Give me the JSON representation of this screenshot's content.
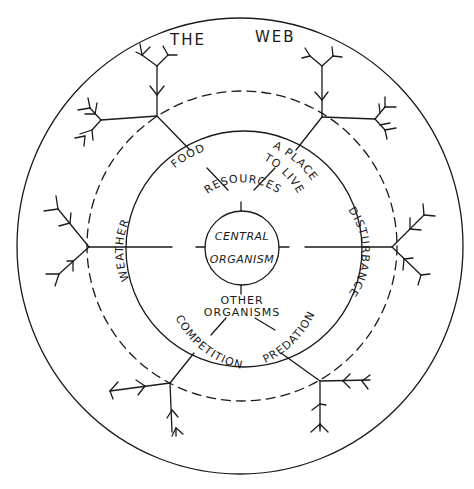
{
  "diagram": {
    "title": {
      "word1": "THE",
      "word2": "WEB"
    },
    "center": {
      "line1": "CENTRAL",
      "line2": "ORGANISM"
    },
    "inner_ring": {
      "top": "RESOURCES",
      "left": "WEATHER",
      "right": "DISTURBANCE",
      "bottom_line1": "OTHER",
      "bottom_line2": "ORGANISMS"
    },
    "middle_ring": {
      "upper_left": "FOOD",
      "upper_right_line1": "A PLACE",
      "upper_right_line2": "TO LIVE",
      "lower_left": "COMPETITION",
      "lower_right": "PREDATION"
    },
    "outer_ring": {
      "boundary_style": "dashed",
      "branching_trees": 6
    },
    "colors": {
      "ink": "#1a1a1a",
      "background": "#ffffff"
    }
  }
}
